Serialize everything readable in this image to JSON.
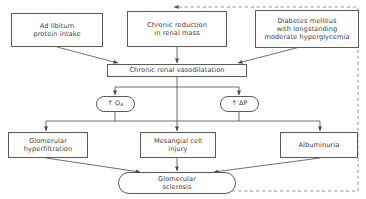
{
  "diagram": {
    "type": "flowchart",
    "colors": {
      "box_border": "#5a5a5a",
      "text": "#3d3d3d",
      "connector": "#4a4a4a",
      "feedback_dashed": "#8a8a8a",
      "background": "#ffffff"
    },
    "nodes": {
      "ad_libitum": {
        "id": "ad-libitum-protein-intake",
        "label": "Ad libitum\nprotein intake",
        "shape": "rectangle",
        "row": "causes"
      },
      "chronic_reduction": {
        "id": "chronic-reduction-renal-mass",
        "label": "Chronic reduction\nin renal mass",
        "shape": "rectangle",
        "row": "causes"
      },
      "diabetes": {
        "id": "diabetes-mellitus",
        "label": "Diabetes mellitus\nwith longstanding\nmoderate hyperglycemia",
        "shape": "rectangle",
        "row": "causes"
      },
      "vasodilatation": {
        "id": "chronic-renal-vasodilatation",
        "label": "Chronic renal vasodilatation",
        "shape": "rectangle",
        "row": "mechanism"
      },
      "qa": {
        "id": "increased-qa",
        "label": "↑ Q",
        "subscript": "A",
        "shape": "rounded",
        "row": "hemodynamics"
      },
      "dp": {
        "id": "increased-delta-p",
        "label": "↑ ΔP",
        "subscript": "",
        "shape": "rounded",
        "row": "hemodynamics"
      },
      "hyperfiltration": {
        "id": "glomerular-hyperfiltration",
        "label": "Glomerular\nhyperfiltration",
        "shape": "rectangle",
        "row": "consequences"
      },
      "mesangial": {
        "id": "mesangial-cell-injury",
        "label": "Mesangial cell\ninjury",
        "shape": "rectangle",
        "row": "consequences"
      },
      "albuminuria": {
        "id": "albuminuria",
        "label": "Albuminuria",
        "shape": "rectangle",
        "row": "consequences"
      },
      "sclerosis": {
        "id": "glomerular-sclerosis",
        "label": "Glomerular\nsclerosis",
        "shape": "rounded",
        "row": "outcome"
      }
    },
    "edges": [
      {
        "from": "ad_libitum",
        "to": "vasodilatation",
        "style": "solid",
        "arrow": true
      },
      {
        "from": "chronic_reduction",
        "to": "vasodilatation",
        "style": "solid",
        "arrow": true
      },
      {
        "from": "diabetes",
        "to": "vasodilatation",
        "style": "solid",
        "arrow": true
      },
      {
        "from": "vasodilatation",
        "to": "qa",
        "style": "solid",
        "arrow": true
      },
      {
        "from": "vasodilatation",
        "to": "dp",
        "style": "solid",
        "arrow": true
      },
      {
        "from": "qa",
        "to": "hyperfiltration",
        "style": "solid",
        "arrow": true
      },
      {
        "from": "qa",
        "to": "mesangial",
        "style": "solid",
        "arrow": true
      },
      {
        "from": "dp",
        "to": "albuminuria",
        "style": "solid",
        "arrow": true
      },
      {
        "from": "hyperfiltration",
        "to": "sclerosis",
        "style": "solid",
        "arrow": true
      },
      {
        "from": "mesangial",
        "to": "sclerosis",
        "style": "solid",
        "arrow": true
      },
      {
        "from": "albuminuria",
        "to": "sclerosis",
        "style": "solid",
        "arrow": true
      },
      {
        "from": "sclerosis",
        "to": "chronic_reduction",
        "style": "dashed",
        "arrow": true,
        "note": "feedback loop around right side"
      }
    ]
  }
}
